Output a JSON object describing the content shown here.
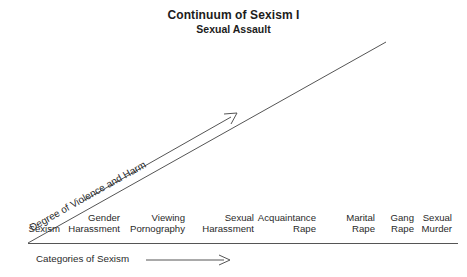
{
  "title": {
    "main": "Continuum of Sexism I",
    "sub": "Sexual Assault"
  },
  "axes": {
    "y_label": "Degree of Violence and Harm",
    "x_caption": "Categories of Sexism",
    "x_arrow_icon": "right-arrow-icon",
    "diagonal_icon": "diagonal-trend-line",
    "diagonal_arrow_icon": "diagonal-arrow-icon"
  },
  "categories": [
    {
      "line1": "",
      "line2": "Sexism",
      "x": 60,
      "single": true
    },
    {
      "line1": "Gender",
      "line2": "Harassment",
      "x": 120,
      "single": false
    },
    {
      "line1": "Viewing",
      "line2": "Pornography",
      "x": 185,
      "single": false
    },
    {
      "line1": "Sexual",
      "line2": "Harassment",
      "x": 254,
      "single": false
    },
    {
      "line1": "Acquaintance",
      "line2": "Rape",
      "x": 316,
      "single": false
    },
    {
      "line1": "Marital",
      "line2": "Rape",
      "x": 375,
      "single": false
    },
    {
      "line1": "Gang",
      "line2": "Rape",
      "x": 414,
      "single": false
    },
    {
      "line1": "Sexual",
      "line2": "Murder",
      "x": 452,
      "single": false
    }
  ],
  "colors": {
    "background": "#ffffff",
    "ink": "#2a2a2a",
    "line": "#555555",
    "title_ink": "#1c1c1c"
  }
}
